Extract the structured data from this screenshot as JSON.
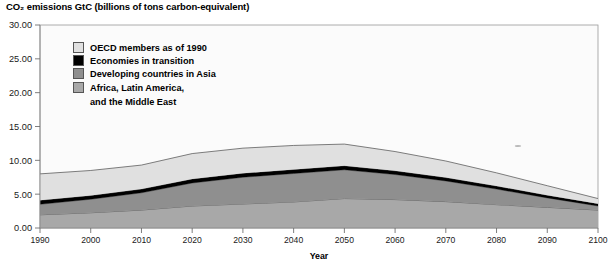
{
  "chart_data": {
    "type": "area",
    "title": "CO₂ emissions GtC (billions of tons carbon-equivalent)",
    "xlabel": "Year",
    "ylabel": "",
    "stacked": true,
    "grid": false,
    "legend_position": "top-left inside plot",
    "xlim": [
      1990,
      2100
    ],
    "ylim": [
      0,
      30
    ],
    "ytick_labels": [
      "0.00",
      "5.00",
      "10.00",
      "15.00",
      "20.00",
      "25.00",
      "30.00"
    ],
    "ytick_values": [
      0,
      5,
      10,
      15,
      20,
      25,
      30
    ],
    "xtick_labels": [
      "1990",
      "2000",
      "2010",
      "2020",
      "2030",
      "2040",
      "2050",
      "2060",
      "2070",
      "2080",
      "2090",
      "2100"
    ],
    "x": [
      1990,
      2000,
      2010,
      2020,
      2030,
      2040,
      2050,
      2060,
      2070,
      2080,
      2090,
      2100
    ],
    "series": [
      {
        "name": "Africa, Latin America, and the Middle East",
        "color": "#a8a8a8",
        "values": [
          1.95,
          2.25,
          2.65,
          3.25,
          3.55,
          3.85,
          4.35,
          4.2,
          3.9,
          3.45,
          3.05,
          2.65
        ]
      },
      {
        "name": "Developing countries in Asia",
        "color": "#8f8f8f",
        "values": [
          1.55,
          2.0,
          2.55,
          3.4,
          3.95,
          4.2,
          4.25,
          3.7,
          3.05,
          2.3,
          1.4,
          0.6
        ]
      },
      {
        "name": "Economies in transition",
        "color": "#000000",
        "values": [
          0.6,
          0.55,
          0.55,
          0.6,
          0.6,
          0.6,
          0.6,
          0.55,
          0.5,
          0.45,
          0.4,
          0.35
        ]
      },
      {
        "name": "OECD members as of 1990",
        "color": "#e0e0e0",
        "values": [
          3.9,
          3.7,
          3.55,
          3.75,
          3.7,
          3.55,
          3.2,
          2.85,
          2.45,
          1.95,
          1.4,
          0.75
        ]
      }
    ],
    "series_display_order_legend": [
      "OECD members as of 1990",
      "Economies in transition",
      "Developing countries in Asia",
      "Africa, Latin America, and the Middle East"
    ],
    "totals": [
      8.0,
      8.5,
      9.3,
      11.0,
      11.8,
      12.2,
      12.4,
      11.3,
      9.9,
      8.15,
      6.25,
      4.35
    ]
  },
  "legend": {
    "items": [
      {
        "label": "OECD members as of 1990",
        "color": "#e0e0e0"
      },
      {
        "label": "Economies in transition",
        "color": "#000000"
      },
      {
        "label": "Developing countries in Asia",
        "color": "#8f8f8f"
      },
      {
        "label": "Africa, Latin America,",
        "label2": "and the Middle East",
        "color": "#a8a8a8"
      }
    ]
  },
  "axes": {
    "x_title": "Year"
  }
}
